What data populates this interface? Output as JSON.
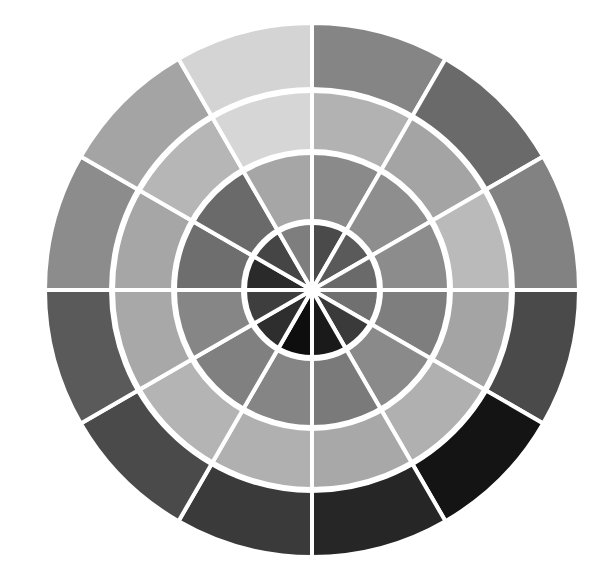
{
  "diagram": {
    "type": "segmented-color-wheel",
    "center": [
      312,
      290
    ],
    "segments_per_ring": 12,
    "start_angle_deg": -90,
    "rings": [
      {
        "name": "inner",
        "r_inner": 0,
        "r_outer": 68,
        "colors": [
          "#4a4a4a",
          "#5a5a5a",
          "#6a6a6a",
          "#707070",
          "#3a3a3a",
          "#1a1a1a",
          "#0e0e0e",
          "#2e2e2e",
          "#3e3e3e",
          "#2a2a2a",
          "#454545",
          "#7e7e7e"
        ]
      },
      {
        "name": "middle",
        "r_inner": 68,
        "r_outer": 138,
        "colors": [
          "#8a8a8a",
          "#8e8e8e",
          "#8c8c8c",
          "#7e7e7e",
          "#8a8a8a",
          "#7a7a7a",
          "#858585",
          "#808080",
          "#868686",
          "#6e6e6e",
          "#6a6a6a",
          "#a6a6a6"
        ]
      },
      {
        "name": "outer-middle",
        "r_inner": 138,
        "r_outer": 200,
        "colors": [
          "#b2b2b2",
          "#a4a4a4",
          "#bababa",
          "#a4a4a4",
          "#b0b0b0",
          "#a8a8a8",
          "#b0b0b0",
          "#b4b4b4",
          "#a8a8a8",
          "#a6a6a6",
          "#b6b6b6",
          "#d6d6d6"
        ]
      },
      {
        "name": "outer",
        "r_inner": 200,
        "r_outer": 267,
        "colors": [
          "#858585",
          "#6a6a6a",
          "#828282",
          "#4a4a4a",
          "#141414",
          "#262626",
          "#3a3a3a",
          "#4a4a4a",
          "#5a5a5a",
          "#8c8c8c",
          "#a4a4a4",
          "#d4d4d4"
        ]
      }
    ],
    "divider_color": "#ffffff"
  }
}
